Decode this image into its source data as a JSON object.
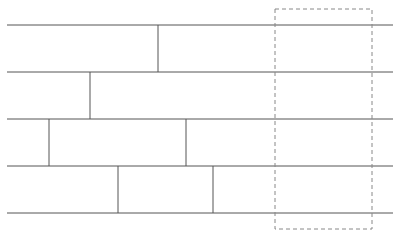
{
  "diagram": {
    "type": "brick-wall-planks",
    "stroke_color": "#555555",
    "dash_color": "#888888",
    "horizontal_lines_y": [
      25,
      72,
      119,
      166,
      213
    ],
    "line_x_start": 7,
    "line_x_end": 393,
    "rows": [
      {
        "top": 25,
        "bottom": 72,
        "joints_x": [
          158
        ]
      },
      {
        "top": 72,
        "bottom": 119,
        "joints_x": [
          90
        ]
      },
      {
        "top": 119,
        "bottom": 166,
        "joints_x": [
          49,
          186
        ]
      },
      {
        "top": 166,
        "bottom": 213,
        "joints_x": [
          118,
          213
        ]
      }
    ],
    "selection_box": {
      "x": 275,
      "y": 9,
      "width": 97,
      "height": 220,
      "style": "dashed"
    }
  }
}
